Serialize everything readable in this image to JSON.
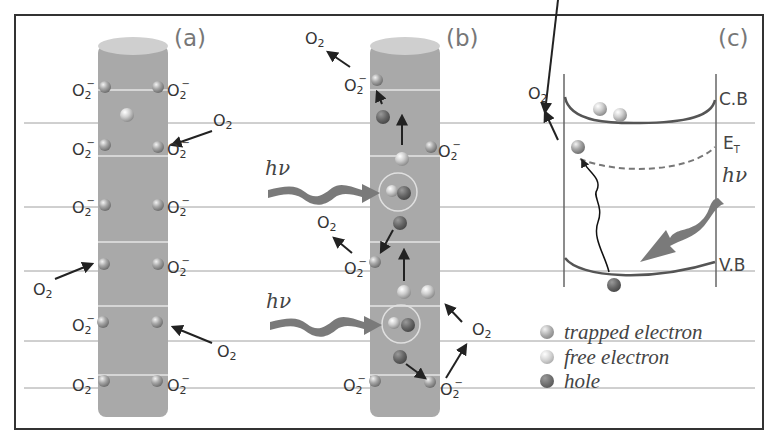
{
  "figure": {
    "panels": [
      {
        "id": "a",
        "label": "(a)"
      },
      {
        "id": "b",
        "label": "(b)"
      },
      {
        "id": "c",
        "label": "(c)"
      }
    ],
    "species": {
      "oxygen": "O2",
      "superoxide": "O2⁻",
      "photon": "hν"
    },
    "band_labels": {
      "conduction": "C.B",
      "trap": "E",
      "trap_sub": "T",
      "valence": "V.B"
    },
    "legend": [
      {
        "label": "trapped electron",
        "color": "#9a9a9a"
      },
      {
        "label": "free electron",
        "color": "#c8c8c8"
      },
      {
        "label": "hole",
        "color": "#6a6a6a"
      }
    ],
    "colors": {
      "rod": "#a9a9a9",
      "rod_top": "#cfcfcf",
      "photon_arrow": "#7a7a7a",
      "frame": "#333333",
      "guide_line": "#9a9a9a"
    }
  }
}
